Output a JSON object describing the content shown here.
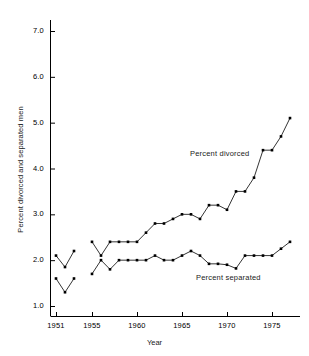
{
  "chart_data": {
    "type": "line",
    "title": "",
    "xlabel": "Year",
    "ylabel": "Percent divorced and separated men",
    "xlim": [
      1950.0,
      1978.0
    ],
    "ylim": [
      0.8,
      7.4
    ],
    "grid": false,
    "legend_position": "inline-annotations",
    "x_ticks": [
      1951,
      1955,
      1960,
      1965,
      1970,
      1975
    ],
    "x_tick_labels": [
      "1951",
      "1955",
      "1960",
      "1965",
      "1970",
      "1975"
    ],
    "y_ticks": [
      1.0,
      2.0,
      3.0,
      4.0,
      5.0,
      6.0,
      7.0
    ],
    "y_tick_labels": [
      "1.0",
      "2.0",
      "3.0",
      "4.0",
      "5.0",
      "6.0",
      "7.0"
    ],
    "marker": "square",
    "line_color": "#000000",
    "series": [
      {
        "name": "Percent divorced",
        "annotation": "Percent divorced",
        "segments": [
          {
            "x": [
              1951,
              1952,
              1953
            ],
            "y": [
              2.1,
              1.85,
              2.2
            ]
          },
          {
            "x": [
              1955,
              1956,
              1957,
              1958,
              1959,
              1960,
              1961,
              1962,
              1963,
              1964,
              1965,
              1966,
              1967,
              1968,
              1969,
              1970,
              1971,
              1972,
              1973,
              1974,
              1975,
              1976,
              1977
            ],
            "y": [
              2.4,
              2.1,
              2.4,
              2.4,
              2.4,
              2.4,
              2.6,
              2.8,
              2.8,
              2.9,
              3.0,
              3.0,
              2.9,
              3.2,
              3.2,
              3.1,
              3.5,
              3.5,
              3.8,
              4.4,
              4.4,
              4.7,
              5.1
            ]
          }
        ]
      },
      {
        "name": "Percent separated",
        "annotation": "Percent separated",
        "segments": [
          {
            "x": [
              1951,
              1952,
              1953
            ],
            "y": [
              1.6,
              1.3,
              1.6
            ]
          },
          {
            "x": [
              1955,
              1956,
              1957,
              1958,
              1959,
              1960,
              1961,
              1962,
              1963,
              1964,
              1965,
              1966,
              1967,
              1968,
              1969,
              1970,
              1971,
              1972,
              1973,
              1974,
              1975,
              1976,
              1977
            ],
            "y": [
              1.7,
              2.0,
              1.8,
              2.0,
              2.0,
              2.0,
              2.0,
              2.1,
              2.0,
              2.0,
              2.1,
              2.2,
              2.1,
              1.92,
              1.92,
              1.9,
              1.82,
              2.1,
              2.1,
              2.1,
              2.1,
              2.25,
              2.4
            ]
          }
        ]
      }
    ]
  },
  "axes": {
    "x_title": "Year",
    "y_title": "Percent divorced and separated men"
  },
  "annotations": {
    "divorced": "Percent divorced",
    "separated": "Percent separated"
  }
}
